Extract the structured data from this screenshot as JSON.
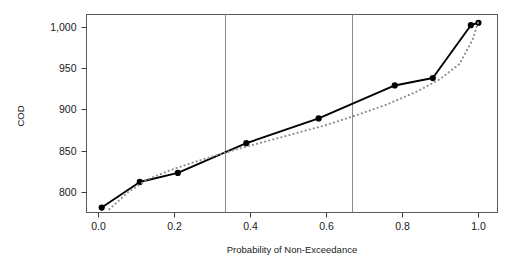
{
  "chart_data": {
    "type": "line",
    "title": "",
    "xlabel": "Probability of Non-Exceedance",
    "ylabel": "COD",
    "xlim": [
      -0.03,
      1.05
    ],
    "ylim": [
      775,
      1015
    ],
    "xticks": [
      0.0,
      0.2,
      0.4,
      0.6,
      0.8,
      1.0
    ],
    "xticklabels": [
      "0.0",
      "0.2",
      "0.4",
      "0.6",
      "0.8",
      "1.0"
    ],
    "yticks": [
      800,
      850,
      900,
      950,
      1000
    ],
    "yticklabels": [
      "800",
      "850",
      "900",
      "950",
      "1,000"
    ],
    "grid": false,
    "legend": "none",
    "reference_lines": {
      "orientation": "vertical",
      "x": [
        0.3333,
        0.6667
      ],
      "color": "#8a8a8a"
    },
    "series": [
      {
        "name": "Empirical",
        "style": "solid-with-markers",
        "color": "#000000",
        "marker": "filled-circle",
        "x": [
          0.01,
          0.11,
          0.21,
          0.39,
          0.58,
          0.78,
          0.88,
          0.98,
          1.0
        ],
        "values": [
          781,
          812,
          823,
          859,
          889,
          929,
          938,
          1002,
          1005
        ]
      },
      {
        "name": "Fitted",
        "style": "dotted",
        "color": "#8f8f8f",
        "marker": "none",
        "x": [
          0.03,
          0.08,
          0.13,
          0.2,
          0.28,
          0.36,
          0.44,
          0.52,
          0.6,
          0.68,
          0.76,
          0.84,
          0.9,
          0.95,
          0.985,
          1.0
        ],
        "values": [
          779,
          800,
          815,
          828,
          840,
          851,
          861,
          871,
          881,
          893,
          906,
          922,
          937,
          955,
          985,
          1007
        ]
      }
    ]
  },
  "axes": {
    "x_title": "Probability of Non-Exceedance",
    "y_title": "COD"
  }
}
